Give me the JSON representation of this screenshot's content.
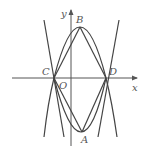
{
  "diagram": {
    "type": "coordinate-geometry",
    "axes": {
      "x_label": "x",
      "y_label": "y",
      "origin_label": "O"
    },
    "points": {
      "A": {
        "label": "A",
        "px": [
          82,
          132
        ]
      },
      "B": {
        "label": "B",
        "px": [
          80,
          27
        ]
      },
      "C": {
        "label": "C",
        "px": [
          54,
          78
        ]
      },
      "D": {
        "label": "D",
        "px": [
          106,
          78
        ]
      },
      "O": {
        "label": "O",
        "px": [
          71,
          78
        ]
      }
    },
    "colors": {
      "line": "#444444",
      "text": "#555555",
      "background": "#ffffff"
    }
  }
}
